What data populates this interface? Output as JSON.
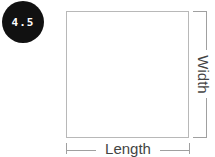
{
  "badge": {
    "value": "4.5",
    "bg": "#111111",
    "fg": "#ffffff"
  },
  "diagram": {
    "shape": "rectangle",
    "stroke": "#b8b8b8",
    "labels": {
      "length": "Length",
      "width": "Width"
    }
  }
}
